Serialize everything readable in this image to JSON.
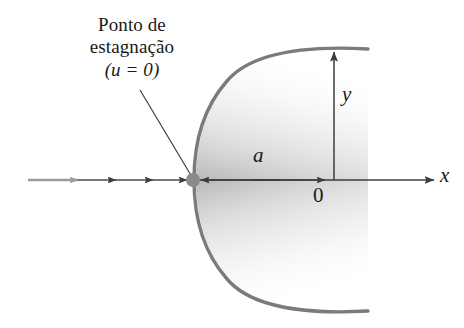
{
  "figure": {
    "type": "fluid-flow-diagram",
    "background_color": "#ffffff",
    "callout": {
      "line1": "Ponto de",
      "line2": "estagnação",
      "line3": "(u = 0)",
      "leader_from": [
        140,
        90
      ],
      "leader_to": [
        192,
        177
      ]
    },
    "axes": {
      "x_label": "x",
      "y_label": "y",
      "origin_label": "0",
      "origin_point": [
        334,
        180
      ],
      "x_axis_y": 180,
      "x_axis_end": 434,
      "y_axis_top": 52
    },
    "dimension": {
      "label": "a",
      "from_x": 200,
      "to_x": 330,
      "y": 180
    },
    "stagnation_point": {
      "x": 193,
      "y": 180,
      "radius": 7,
      "color": "#8a8a8a"
    },
    "flow_arrows": {
      "count": 4,
      "y": 180,
      "tip_positions": [
        78,
        115,
        152,
        186
      ],
      "first_color": "#9b9b9b",
      "color": "#4a4a4a"
    },
    "body": {
      "outline_color": "#7b7b7b",
      "shade_color": "#c9c9c9",
      "nose_x": 196,
      "exit_x": 368,
      "upper_exit_y": 50,
      "lower_exit_y": 310
    },
    "colors": {
      "ink": "#1a1a1a",
      "axis": "#3d3d3d",
      "outline": "#7b7b7b",
      "shade": "#c9c9c9",
      "dot": "#8a8a8a",
      "flow_light": "#9b9b9b"
    }
  }
}
